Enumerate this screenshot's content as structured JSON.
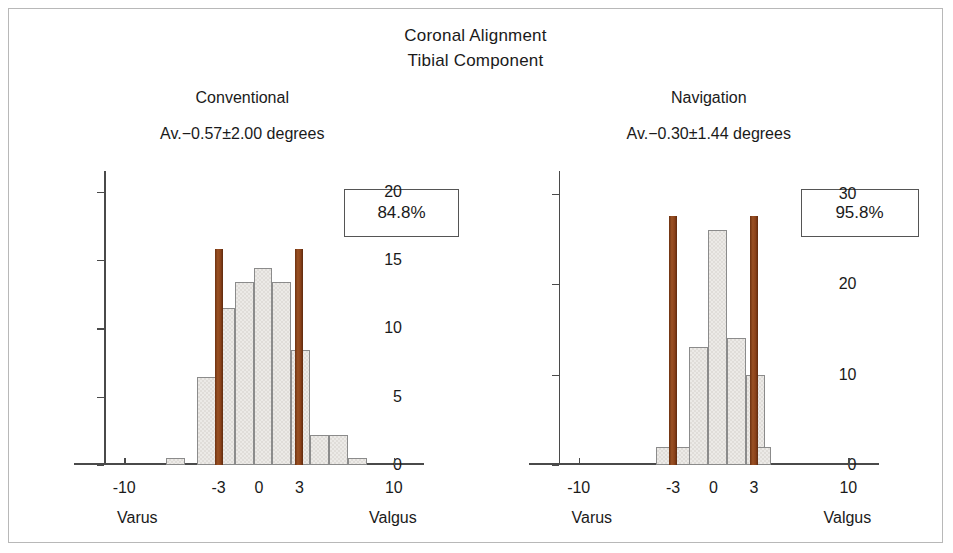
{
  "figure": {
    "title_line1": "Coronal Alignment",
    "title_line2": "Tibial Component"
  },
  "chart_data": {
    "type": "bar",
    "title": "Coronal Alignment Tibial Component",
    "panels": [
      {
        "name": "conventional",
        "panel_title": "Conventional",
        "stats_label": "Av.−0.57±2.00 degrees",
        "mean": -0.57,
        "sd": 2.0,
        "percent_in_range_label": "84.8%",
        "percent_in_range": 84.8,
        "xlabel_left": "Varus",
        "xlabel_right": "Valgus",
        "ylabel": "",
        "ylim": [
          0,
          21.5
        ],
        "yticks": [
          0,
          5,
          10,
          15,
          20
        ],
        "ytick_labels": [
          "0",
          "5",
          "10",
          "15",
          "20"
        ],
        "xlim": [
          -11.5,
          11.5
        ],
        "xticks": [
          -10,
          -3,
          0,
          3,
          10
        ],
        "xtick_labels": [
          "-10",
          "-3",
          "0",
          "3",
          "10"
        ],
        "grid": false,
        "bin_width": 1.4,
        "bars": [
          {
            "x": -6.2,
            "value": 0.5
          },
          {
            "x": -3.9,
            "value": 6.4
          },
          {
            "x": -2.5,
            "value": 11.5
          },
          {
            "x": -1.1,
            "value": 13.4
          },
          {
            "x": 0.3,
            "value": 14.4
          },
          {
            "x": 1.7,
            "value": 13.4
          },
          {
            "x": 3.1,
            "value": 8.4
          },
          {
            "x": 4.5,
            "value": 2.2
          },
          {
            "x": 5.9,
            "value": 2.2
          },
          {
            "x": 7.3,
            "value": 0.5
          }
        ],
        "markers": [
          {
            "x": -3,
            "value": 15.8
          },
          {
            "x": 3,
            "value": 15.8
          }
        ]
      },
      {
        "name": "navigation",
        "panel_title": "Navigation",
        "stats_label": "Av.−0.30±1.44 degrees",
        "mean": -0.3,
        "sd": 1.44,
        "percent_in_range_label": "95.8%",
        "percent_in_range": 95.8,
        "xlabel_left": "Varus",
        "xlabel_right": "Valgus",
        "ylabel": "",
        "ylim": [
          0,
          32.5
        ],
        "yticks": [
          0,
          10,
          20,
          30
        ],
        "ytick_labels": [
          "0",
          "10",
          "20",
          "30"
        ],
        "xlim": [
          -11.5,
          11.5
        ],
        "xticks": [
          -10,
          -3,
          0,
          3,
          10
        ],
        "xtick_labels": [
          "-10",
          "-3",
          "0",
          "3",
          "10"
        ],
        "grid": false,
        "bin_width": 1.4,
        "bars": [
          {
            "x": -3.6,
            "value": 2.0
          },
          {
            "x": -2.2,
            "value": 2.0
          },
          {
            "x": -1.1,
            "value": 13.0
          },
          {
            "x": 0.3,
            "value": 26.0
          },
          {
            "x": 1.7,
            "value": 14.0
          },
          {
            "x": 3.1,
            "value": 10.0
          },
          {
            "x": 3.6,
            "value": 2.0
          }
        ],
        "markers": [
          {
            "x": -3,
            "value": 27.5
          },
          {
            "x": 3,
            "value": 27.5
          }
        ]
      }
    ],
    "marker_color": "#8a4119",
    "bar_fill_color": "#eceae7",
    "bar_edge_color": "#8b8b8b",
    "axis_color": "#4a4a4a",
    "frame_color": "#b8b8b8"
  }
}
